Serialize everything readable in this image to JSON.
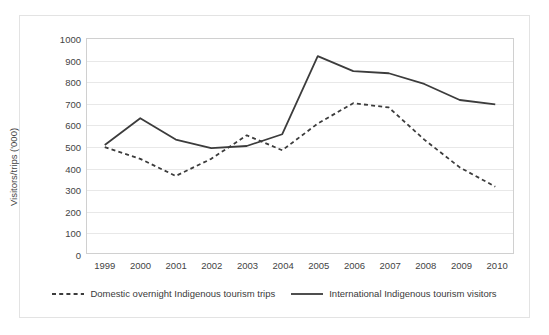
{
  "chart_data": {
    "type": "line",
    "title": "",
    "xlabel": "",
    "ylabel": "Visitors/trips ('000)",
    "categories": [
      "1999",
      "2000",
      "2001",
      "2002",
      "2003",
      "2004",
      "2005",
      "2006",
      "2007",
      "2008",
      "2009",
      "2010"
    ],
    "ylim": [
      0,
      1000
    ],
    "ytick_step": 100,
    "yticks": [
      "1000",
      "900",
      "800",
      "700",
      "600",
      "500",
      "400",
      "300",
      "200",
      "100",
      "0"
    ],
    "grid": true,
    "legend_position": "bottom",
    "series": [
      {
        "name": "Domestic overnight Indigenous tourism trips",
        "style": "dashed",
        "color": "#3c3c3c",
        "values": [
          495,
          440,
          360,
          440,
          550,
          480,
          605,
          700,
          680,
          530,
          400,
          310
        ]
      },
      {
        "name": "International Indigenous tourism visitors",
        "style": "solid",
        "color": "#3c3c3c",
        "values": [
          505,
          630,
          530,
          490,
          500,
          555,
          920,
          850,
          840,
          790,
          715,
          695
        ]
      }
    ]
  }
}
